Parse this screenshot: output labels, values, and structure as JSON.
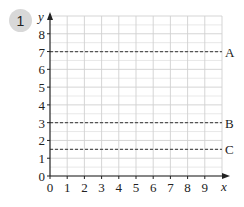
{
  "question": {
    "number": "1"
  },
  "chart_data": {
    "type": "line",
    "title": "",
    "xlabel": "x",
    "ylabel": "y",
    "xlim": [
      0,
      10
    ],
    "ylim": [
      0,
      9
    ],
    "grid": true,
    "x_ticks": [
      "0",
      "1",
      "2",
      "3",
      "4",
      "5",
      "6",
      "7",
      "8",
      "9"
    ],
    "y_ticks": [
      "0",
      "1",
      "2",
      "3",
      "4",
      "5",
      "6",
      "7",
      "8"
    ],
    "series": [
      {
        "name": "A",
        "equation": "y = 7",
        "y": 7,
        "style": "dashed"
      },
      {
        "name": "B",
        "equation": "y = 3",
        "y": 3,
        "style": "dashed"
      },
      {
        "name": "C",
        "equation": "y = 1.5",
        "y": 1.5,
        "style": "dashed"
      }
    ],
    "colors": {
      "grid": "#d0d0d0",
      "axis": "#222222",
      "lines": "#555555"
    }
  }
}
